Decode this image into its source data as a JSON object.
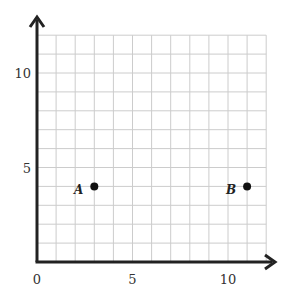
{
  "chart_data": {
    "type": "scatter",
    "title": "",
    "xlabel": "",
    "ylabel": "",
    "xlim": [
      0,
      12
    ],
    "ylim": [
      0,
      12
    ],
    "grid": true,
    "grid_step": 1,
    "x_ticks": [
      {
        "value": 0,
        "label": "0"
      },
      {
        "value": 5,
        "label": "5"
      },
      {
        "value": 10,
        "label": "10"
      }
    ],
    "y_ticks": [
      {
        "value": 5,
        "label": "5"
      },
      {
        "value": 10,
        "label": "10"
      }
    ],
    "points": [
      {
        "label": "A",
        "x": 3,
        "y": 4
      },
      {
        "label": "B",
        "x": 11,
        "y": 4
      }
    ],
    "colors": {
      "axis": "#222222",
      "grid": "#cccccc",
      "point": "#111111"
    }
  }
}
